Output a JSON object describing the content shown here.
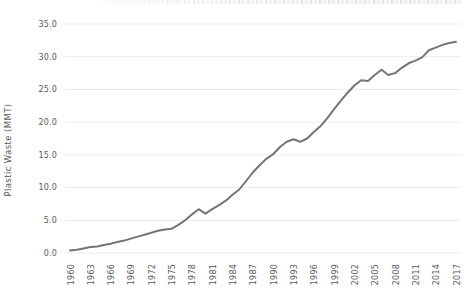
{
  "chart_data": {
    "type": "line",
    "title": "",
    "xlabel": "",
    "ylabel": "Plastic Waste (MMT)",
    "legend": "none",
    "grid": "horizontal",
    "ylim": [
      0,
      35
    ],
    "yticks": [
      0,
      5,
      10,
      15,
      20,
      25,
      30,
      35
    ],
    "ytick_labels": [
      "0.0",
      "5.0",
      "10.0",
      "15.0",
      "20.0",
      "25.0",
      "30.0",
      "35.0"
    ],
    "xticks": [
      1960,
      1963,
      1966,
      1969,
      1972,
      1975,
      1978,
      1981,
      1984,
      1987,
      1990,
      1993,
      1996,
      1999,
      2002,
      2005,
      2008,
      2011,
      2014,
      2017
    ],
    "x": [
      1960,
      1961,
      1962,
      1963,
      1964,
      1965,
      1966,
      1967,
      1968,
      1969,
      1970,
      1971,
      1972,
      1973,
      1974,
      1975,
      1976,
      1977,
      1978,
      1979,
      1980,
      1981,
      1982,
      1983,
      1984,
      1985,
      1986,
      1987,
      1988,
      1989,
      1990,
      1991,
      1992,
      1993,
      1994,
      1995,
      1996,
      1997,
      1998,
      1999,
      2000,
      2001,
      2002,
      2003,
      2004,
      2005,
      2006,
      2007,
      2008,
      2009,
      2010,
      2011,
      2012,
      2013,
      2014,
      2015,
      2016,
      2017
    ],
    "series": [
      {
        "name": "Plastic waste",
        "values": [
          0.4,
          0.5,
          0.7,
          0.9,
          1.0,
          1.2,
          1.4,
          1.7,
          1.9,
          2.2,
          2.5,
          2.8,
          3.1,
          3.4,
          3.6,
          3.7,
          4.3,
          5.0,
          5.9,
          6.7,
          6.0,
          6.7,
          7.3,
          8.0,
          8.9,
          9.7,
          11.0,
          12.3,
          13.4,
          14.4,
          15.1,
          16.2,
          17.0,
          17.4,
          17.0,
          17.5,
          18.5,
          19.4,
          20.6,
          22.0,
          23.3,
          24.5,
          25.6,
          26.4,
          26.3,
          27.2,
          28.0,
          27.2,
          27.5,
          28.3,
          29.0,
          29.4,
          29.9,
          31.0,
          31.4,
          31.8,
          32.1,
          32.3
        ]
      }
    ],
    "colors": {
      "line": "#757575",
      "grid": "#ebebeb",
      "text": "#595959",
      "background": "#ffffff"
    }
  }
}
